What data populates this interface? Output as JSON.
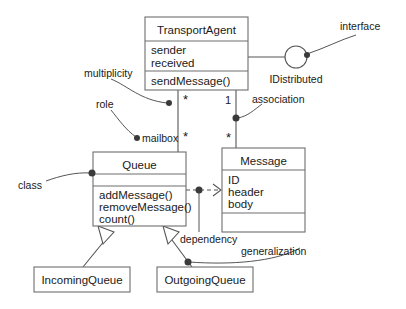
{
  "diagram": {
    "kind": "uml-class-diagram",
    "background": "#ffffff",
    "line_color": "#555555",
    "box_stroke": "#6e6e6e",
    "text_color": "#1a1a1a"
  },
  "classes": {
    "transport_agent": {
      "name": "TransportAgent",
      "attributes": [
        "sender",
        "received"
      ],
      "operations": [
        "sendMessage()"
      ]
    },
    "queue": {
      "name": "Queue",
      "attributes": [],
      "operations": [
        "addMessage()",
        "removeMessage()",
        "count()"
      ]
    },
    "message": {
      "name": "Message",
      "attributes": [
        "ID",
        "header",
        "body"
      ],
      "operations": []
    },
    "incoming_queue": {
      "name": "IncomingQueue"
    },
    "outgoing_queue": {
      "name": "OutgoingQueue"
    }
  },
  "interface": {
    "name": "IDistributed"
  },
  "multiplicities": {
    "agent_to_queue_top": "*",
    "agent_to_queue_bottom": "*",
    "agent_to_message_one": "1",
    "agent_to_message_star": "*"
  },
  "annotations": {
    "interface": "interface",
    "multiplicity": "multiplicity",
    "role": "role",
    "mailbox": "mailbox",
    "association": "association",
    "class": "class",
    "dependency": "dependency",
    "generalization": "generalization"
  }
}
